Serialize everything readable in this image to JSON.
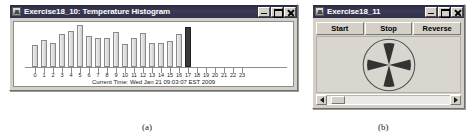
{
  "figure": {
    "caption_a": "(a)",
    "caption_b": "(b)"
  },
  "window_a": {
    "title": "Exercise18_10: Temperature Histogram",
    "icon": "java-coffee-cup-icon",
    "controls": {
      "minimize": "minimize-icon",
      "maximize": "maximize-icon",
      "close": "close-icon"
    },
    "status_text": "Current Time: Wed Jan 21 09:03:07 EST 2009",
    "chart_data": {
      "type": "bar",
      "title": "Temperature Histogram",
      "xlabel": "",
      "ylabel": "",
      "grid": false,
      "legend": null,
      "categories": [
        "0",
        "1",
        "2",
        "3",
        "4",
        "5",
        "6",
        "7",
        "8",
        "9",
        "10",
        "11",
        "12",
        "13",
        "14",
        "15",
        "16",
        "17",
        "18",
        "19",
        "20",
        "21",
        "22",
        "23"
      ],
      "values": [
        20,
        25,
        22,
        30,
        33,
        38,
        28,
        26,
        26,
        32,
        21,
        26,
        31,
        22,
        22,
        24,
        30,
        36,
        0,
        0,
        0,
        0,
        0,
        0
      ],
      "ylim": [
        0,
        40
      ],
      "highlight_index": 17,
      "highlight_color": "#3a3a3a",
      "bar_color": "#e2e2e2",
      "bar_border_color": "#8a8a8a",
      "axis_color": "#8d8d8d"
    }
  },
  "window_b": {
    "title": "Exercise18_11",
    "icon": "java-coffee-cup-icon",
    "controls": {
      "minimize": "minimize-icon",
      "maximize": "maximize-icon",
      "close": "close-icon"
    },
    "buttons": [
      {
        "label": "Start",
        "name": "start-button"
      },
      {
        "label": "Stop",
        "name": "stop-button"
      },
      {
        "label": "Reverse",
        "name": "reverse-button"
      }
    ],
    "fan": {
      "blades": 4,
      "blade_color": "#333333",
      "circle_color": "#555555",
      "panel_color": "#d9d6cf"
    },
    "scrollbar": {
      "orientation": "horizontal",
      "left_arrow": "scroll-left-arrow-icon",
      "right_arrow": "scroll-right-arrow-icon",
      "thumb_position_pct": 4
    }
  }
}
